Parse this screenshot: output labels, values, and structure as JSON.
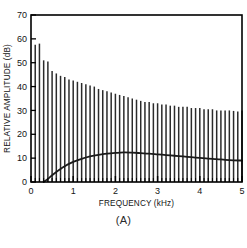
{
  "figure": {
    "caption": "(A)"
  },
  "chart_data": {
    "type": "bar",
    "title": "",
    "subtitle": "",
    "xlabel": "FREQUENCY (kHz)",
    "ylabel": "RELATIVE AMPLITUDE (dB)",
    "xlim": [
      0,
      5
    ],
    "ylim": [
      0,
      70
    ],
    "xticks": [
      0,
      1,
      2,
      3,
      4,
      5
    ],
    "xtick_labels": [
      "0",
      "1",
      "2",
      "3",
      "4",
      "5"
    ],
    "yticks": [
      0,
      10,
      20,
      30,
      40,
      50,
      60,
      70
    ],
    "ytick_labels": [
      "0",
      "10",
      "20",
      "30",
      "40",
      "50",
      "60",
      "70"
    ],
    "xminor_tick_step": 0.1,
    "grid": false,
    "legend": null,
    "legend_position": "none",
    "bar_color": "#2b2b2b",
    "line_color": "#1a1a1a",
    "frame_color": "#000000",
    "background": "#ffffff",
    "series": [
      {
        "name": "Harmonic line spectrum",
        "type": "bar",
        "units": "dB",
        "x": [
          0.1,
          0.2,
          0.3,
          0.4,
          0.5,
          0.6,
          0.7,
          0.8,
          0.9,
          1.0,
          1.1,
          1.2,
          1.3,
          1.4,
          1.5,
          1.6,
          1.7,
          1.8,
          1.9,
          2.0,
          2.1,
          2.2,
          2.3,
          2.4,
          2.5,
          2.6,
          2.7,
          2.8,
          2.9,
          3.0,
          3.1,
          3.2,
          3.3,
          3.4,
          3.5,
          3.6,
          3.7,
          3.8,
          3.9,
          4.0,
          4.1,
          4.2,
          4.3,
          4.4,
          4.5,
          4.6,
          4.7,
          4.8,
          4.9,
          5.0
        ],
        "values": [
          57.5,
          58.0,
          51.0,
          50.5,
          46.5,
          45.5,
          44.5,
          44.0,
          43.0,
          42.5,
          42.0,
          41.5,
          41.0,
          40.5,
          40.0,
          39.0,
          38.5,
          38.0,
          37.5,
          37.0,
          36.5,
          36.0,
          35.5,
          35.0,
          34.5,
          34.0,
          33.5,
          33.5,
          33.0,
          33.0,
          32.5,
          32.5,
          32.0,
          32.0,
          31.5,
          31.5,
          31.5,
          31.0,
          31.0,
          31.0,
          30.5,
          30.5,
          30.5,
          30.0,
          30.0,
          30.0,
          30.0,
          29.8,
          29.5,
          30.0
        ]
      },
      {
        "name": "Envelope curve",
        "type": "line",
        "units": "dB",
        "x": [
          0.3,
          0.4,
          0.5,
          0.6,
          0.7,
          0.8,
          0.9,
          1.0,
          1.2,
          1.4,
          1.6,
          1.8,
          2.0,
          2.2,
          2.4,
          2.6,
          2.8,
          3.0,
          3.2,
          3.4,
          3.6,
          3.8,
          4.0,
          4.2,
          4.4,
          4.6,
          4.8,
          5.0
        ],
        "values": [
          0.0,
          1.3,
          2.8,
          4.2,
          5.5,
          6.6,
          7.6,
          8.4,
          9.7,
          10.7,
          11.4,
          11.9,
          12.2,
          12.4,
          12.3,
          12.1,
          11.9,
          11.6,
          11.3,
          11.0,
          10.7,
          10.4,
          10.1,
          9.8,
          9.6,
          9.3,
          9.1,
          9.0
        ]
      }
    ]
  }
}
